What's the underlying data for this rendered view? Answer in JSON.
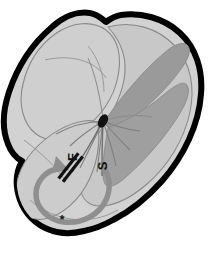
{
  "figure": {
    "type": "anatomical-illustration",
    "background_color": "#ffffff",
    "outline_color": "#000000",
    "palette": {
      "outline": "#000000",
      "tissue_light": "#d2d2d2",
      "tissue_mid": "#c0c0c0",
      "tissue_pale": "#dcdcdc",
      "lobe_dark": "#9a9a9a",
      "lobe_mid_dark": "#a8a8a8",
      "line_gray": "#8a8a8a",
      "arrow_gray": "#8f8f8f",
      "focus_dark": "#121212",
      "label_color": "#111111"
    }
  },
  "labels": {
    "fast_pathway": {
      "text": "F",
      "name": "fast-pathway-label",
      "rotation_deg": -90,
      "x": 77,
      "y": 157
    },
    "slow_pathway": {
      "text": "S",
      "name": "slow-pathway-label",
      "rotation_deg": -90,
      "x": 105,
      "y": 165
    }
  },
  "markers": {
    "focal_point": {
      "name": "focal-point-marker",
      "cx": 103,
      "cy": 121,
      "rx": 4.5,
      "ry": 7,
      "rotation_deg": 25
    },
    "conduction_block": {
      "name": "conduction-block-marker",
      "bars": 2,
      "x": 68,
      "y": 168,
      "rotation_deg": 38
    },
    "asterisk": {
      "name": "asterisk-marker",
      "text": "*",
      "x": 62,
      "y": 220
    }
  },
  "arrows": {
    "reentry_loop": {
      "name": "reentry-circuit-arrow",
      "direction": "counterclockwise",
      "color": "#8f8f8f"
    }
  }
}
